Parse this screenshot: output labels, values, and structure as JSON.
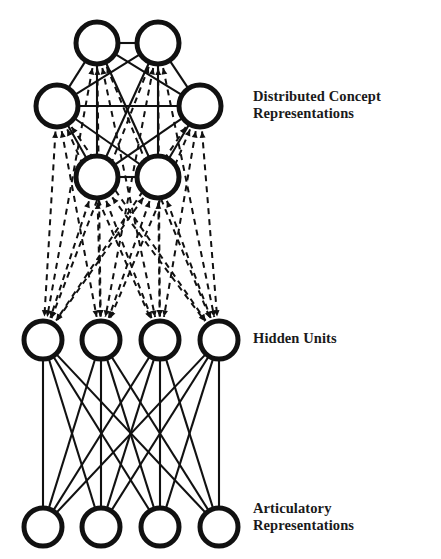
{
  "figure": {
    "type": "neural-network-diagram",
    "background_color": "#ffffff",
    "ink_color": "#111111",
    "width": 441,
    "height": 559
  },
  "labels": {
    "concept": "Distributed Concept\nRepresentations",
    "hidden": "Hidden Units",
    "output": "Articulatory\nRepresentations"
  },
  "layers": [
    {
      "id": "concept",
      "name": "Distributed Concept Representations",
      "node_count": 6,
      "arrangement": "hexagonal-cluster",
      "node_radius": 21,
      "stroke_width": 5,
      "nodes": [
        {
          "id": "c1",
          "cx": 97,
          "cy": 43
        },
        {
          "id": "c2",
          "cx": 158,
          "cy": 43
        },
        {
          "id": "c3",
          "cx": 57,
          "cy": 106
        },
        {
          "id": "c4",
          "cx": 200,
          "cy": 106
        },
        {
          "id": "c5",
          "cx": 97,
          "cy": 177
        },
        {
          "id": "c6",
          "cx": 158,
          "cy": 177
        }
      ]
    },
    {
      "id": "hidden",
      "name": "Hidden Units",
      "node_count": 4,
      "arrangement": "row",
      "node_radius": 19,
      "stroke_width": 5,
      "nodes": [
        {
          "id": "h1",
          "cx": 43,
          "cy": 340
        },
        {
          "id": "h2",
          "cx": 101,
          "cy": 340
        },
        {
          "id": "h3",
          "cx": 160,
          "cy": 340
        },
        {
          "id": "h4",
          "cx": 219,
          "cy": 340
        }
      ]
    },
    {
      "id": "output",
      "name": "Articulatory Representations",
      "node_count": 4,
      "arrangement": "row",
      "node_radius": 19,
      "stroke_width": 5,
      "nodes": [
        {
          "id": "o1",
          "cx": 43,
          "cy": 527
        },
        {
          "id": "o2",
          "cx": 101,
          "cy": 527
        },
        {
          "id": "o3",
          "cx": 160,
          "cy": 527
        },
        {
          "id": "o4",
          "cx": 219,
          "cy": 527
        }
      ]
    }
  ],
  "edge_groups": [
    {
      "id": "concept-intra",
      "style": "solid",
      "stroke_width": 2.1,
      "arrow": "none",
      "description": "complete graph among the six concept nodes",
      "pairs": [
        [
          "c1",
          "c2"
        ],
        [
          "c1",
          "c3"
        ],
        [
          "c1",
          "c4"
        ],
        [
          "c1",
          "c5"
        ],
        [
          "c1",
          "c6"
        ],
        [
          "c2",
          "c3"
        ],
        [
          "c2",
          "c4"
        ],
        [
          "c2",
          "c5"
        ],
        [
          "c2",
          "c6"
        ],
        [
          "c3",
          "c4"
        ],
        [
          "c3",
          "c5"
        ],
        [
          "c3",
          "c6"
        ],
        [
          "c4",
          "c5"
        ],
        [
          "c4",
          "c6"
        ],
        [
          "c5",
          "c6"
        ]
      ]
    },
    {
      "id": "concept-hidden",
      "style": "dashed",
      "stroke_width": 2.0,
      "dash_pattern": "6,5",
      "arrow": "both",
      "description": "bidirectional dashed links between every concept node and every hidden unit",
      "from": [
        "c1",
        "c2",
        "c3",
        "c4",
        "c5",
        "c6"
      ],
      "to": [
        "h1",
        "h2",
        "h3",
        "h4"
      ]
    },
    {
      "id": "hidden-output",
      "style": "solid",
      "stroke_width": 2.1,
      "arrow": "none",
      "description": "fully connected solid links between hidden units and articulatory units",
      "from": [
        "h1",
        "h2",
        "h3",
        "h4"
      ],
      "to": [
        "o1",
        "o2",
        "o3",
        "o4"
      ]
    }
  ]
}
